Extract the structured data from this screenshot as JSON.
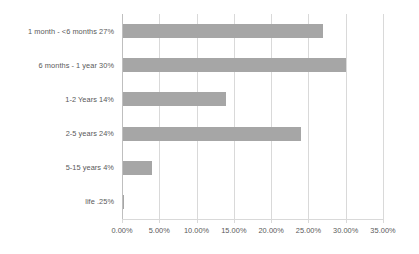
{
  "chart_data": {
    "type": "bar",
    "orientation": "horizontal",
    "title": "",
    "subtitle": "",
    "xlabel": "",
    "ylabel": "",
    "grid": true,
    "legend": false,
    "legend_position": "none",
    "xlim": [
      0,
      35
    ],
    "x_ticks": [
      0,
      5,
      10,
      15,
      20,
      25,
      30,
      35
    ],
    "x_tick_labels": [
      "0.00%",
      "5.00%",
      "10.00%",
      "15.00%",
      "20.00%",
      "25.00%",
      "30.00%",
      "35.00%"
    ],
    "categories": [
      "1 month - <6 months 27%",
      "6 months - 1 year 30%",
      "1-2 Years 14%",
      "2-5 years 24%",
      "5-15 years 4%",
      "life .25%"
    ],
    "values": [
      27,
      30,
      14,
      24,
      4,
      0.25
    ],
    "series": [
      {
        "name": "",
        "values": [
          27,
          30,
          14,
          24,
          4,
          0.25
        ]
      }
    ],
    "bar_color": "#a6a6a6",
    "gridline_color": "#d9d9d9",
    "axis_line_color": "#bfbfbf",
    "text_color": "#595959",
    "background_color": "#ffffff"
  }
}
